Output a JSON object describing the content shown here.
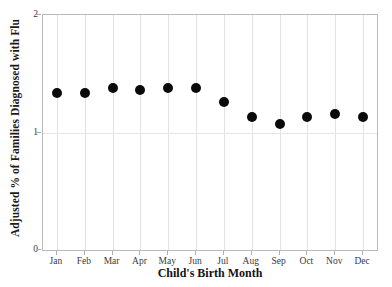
{
  "chart_data": {
    "type": "scatter",
    "title": "",
    "xlabel": "Child's Birth Month",
    "ylabel": "Adjusted % of Families Diagnosed with Flu",
    "categories": [
      "Jan",
      "Feb",
      "Mar",
      "Apr",
      "May",
      "Jun",
      "Jul",
      "Aug",
      "Sep",
      "Oct",
      "Nov",
      "Dec"
    ],
    "values": [
      1.34,
      1.34,
      1.38,
      1.36,
      1.38,
      1.38,
      1.26,
      1.13,
      1.07,
      1.13,
      1.16,
      1.13
    ],
    "series": [
      {
        "name": "Adjusted % of Families Diagnosed with Flu",
        "values": [
          1.34,
          1.34,
          1.38,
          1.36,
          1.38,
          1.38,
          1.26,
          1.13,
          1.07,
          1.13,
          1.16,
          1.13
        ]
      }
    ],
    "ylim": [
      0,
      2
    ],
    "yticks": [
      0,
      1,
      2
    ],
    "ytick_labels": [
      "0",
      "1",
      "2"
    ],
    "grid": true,
    "grid_axis": "both",
    "legend": null,
    "marker": "circle",
    "marker_color": "#0a0a0a",
    "marker_size_px": 10,
    "axis_color": "#b9b9b9",
    "gridline_color": "#e2e2e2",
    "annotations": []
  }
}
